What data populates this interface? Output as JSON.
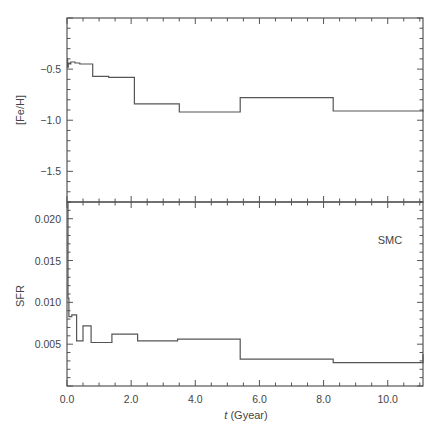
{
  "chart_data": [
    {
      "type": "line",
      "step": true,
      "title": "",
      "xlabel": "t (Gyear)",
      "ylabel": "[Fe/H]",
      "xlim": [
        0,
        11.1
      ],
      "ylim": [
        -1.8,
        0.0
      ],
      "yticks": [
        -0.5,
        -1.0,
        -1.5
      ],
      "ytick_labels": [
        "-0.5",
        "-1.0",
        "-1.5"
      ],
      "x": [
        0.0,
        0.02,
        0.04,
        0.08,
        0.12,
        0.25,
        0.4,
        0.8,
        1.3,
        2.1,
        3.5,
        5.4,
        8.3,
        11.1
      ],
      "values": [
        -0.4,
        -0.48,
        -0.44,
        -0.45,
        -0.43,
        -0.44,
        -0.45,
        -0.57,
        -0.58,
        -0.84,
        -0.92,
        -0.78,
        -0.91,
        -0.9
      ],
      "grid": false
    },
    {
      "type": "line",
      "step": true,
      "title": "",
      "annotation": "SMC",
      "xlabel": "t (Gyear)",
      "ylabel": "SFR",
      "xlim": [
        0,
        11.1
      ],
      "ylim": [
        0,
        0.022
      ],
      "yticks": [
        0.005,
        0.01,
        0.015,
        0.02
      ],
      "ytick_labels": [
        "0.005",
        "0.010",
        "0.015",
        "0.020"
      ],
      "xticks": [
        0,
        2,
        4,
        6,
        8,
        10
      ],
      "xtick_labels": [
        "0.0",
        "2.0",
        "4.0",
        "6.0",
        "8.0",
        "10.0"
      ],
      "x": [
        0.0,
        0.03,
        0.06,
        0.15,
        0.3,
        0.5,
        0.75,
        1.4,
        2.2,
        3.45,
        5.4,
        8.3,
        11.1
      ],
      "values": [
        0.022,
        0.0105,
        0.0083,
        0.0085,
        0.0054,
        0.0072,
        0.0052,
        0.0062,
        0.0054,
        0.0056,
        0.0032,
        0.0028,
        0.0038
      ],
      "grid": false
    }
  ],
  "labels": {
    "top_ylabel": "[Fe/H]",
    "bottom_ylabel": "SFR",
    "xlabel_italic": "t",
    "xlabel_rest": " (Gyear)",
    "annotation": "SMC"
  },
  "colors": {
    "frame": "#555555",
    "line": "#555555",
    "text": "#444444"
  }
}
